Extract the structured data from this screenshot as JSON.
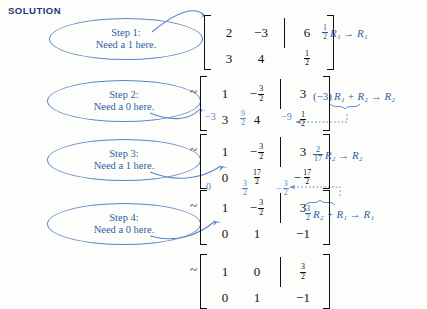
{
  "heading": "SOLUTION",
  "colors": {
    "heading_blue": "#123a76",
    "annotation_blue": "#5a86c8",
    "rowop_blue": "#2e5fa3",
    "matrix_black": "#111111",
    "page_background": "#fdfdfb"
  },
  "callouts": [
    {
      "title": "Step 1:",
      "text": "Need a 1 here."
    },
    {
      "title": "Step 2:",
      "text": "Need a 0 here."
    },
    {
      "title": "Step 3:",
      "text": "Need a 1 here."
    },
    {
      "title": "Step 4:",
      "text": "Need a 0 here."
    }
  ],
  "tilde": "~",
  "matrices": [
    {
      "name": "augmented-matrix-initial",
      "has_tilde": false,
      "rows": [
        {
          "c1": "2",
          "c2": "−3",
          "aug": "6"
        },
        {
          "c1": "3",
          "c2": "4",
          "aug_frac": {
            "num": "1",
            "den": "2"
          }
        }
      ]
    },
    {
      "name": "augmented-matrix-step1",
      "has_tilde": true,
      "rows": [
        {
          "c1": "1",
          "c2_frac_neg": {
            "num": "3",
            "den": "2"
          },
          "aug": "3"
        },
        {
          "c1": "3",
          "c2": "4",
          "aug_frac": {
            "num": "1",
            "den": "2"
          }
        }
      ]
    },
    {
      "name": "augmented-matrix-step2",
      "has_tilde": true,
      "rows": [
        {
          "c1": "1",
          "c2_frac_neg": {
            "num": "3",
            "den": "2"
          },
          "aug": "3"
        },
        {
          "c1": "0",
          "c2_frac": {
            "num": "17",
            "den": "2"
          },
          "aug_frac_neg": {
            "num": "17",
            "den": "2"
          }
        }
      ]
    },
    {
      "name": "augmented-matrix-step3",
      "has_tilde": true,
      "rows": [
        {
          "c1": "1",
          "c2_frac_neg": {
            "num": "3",
            "den": "2"
          },
          "aug": "3"
        },
        {
          "c1": "0",
          "c2": "1",
          "aug": "−1"
        }
      ]
    },
    {
      "name": "augmented-matrix-final",
      "has_tilde": true,
      "rows": [
        {
          "c1": "1",
          "c2": "0",
          "aug_frac": {
            "num": "3",
            "den": "2"
          }
        },
        {
          "c1": "0",
          "c2": "1",
          "aug": "−1"
        }
      ]
    }
  ],
  "row_operations": [
    {
      "name": "row-op-1",
      "coefficient": {
        "num": "1",
        "den": "2"
      },
      "text": "R₁ → R₁",
      "full": "½R₁ → R₁"
    },
    {
      "name": "row-op-2",
      "prefix": "(−3)",
      "text": "R₁ + R₂ → R₂",
      "full": "(−3)R₁ + R₂ → R₂"
    },
    {
      "name": "row-op-3",
      "coefficient": {
        "num": "2",
        "den": "17"
      },
      "text": "R₂ → R₂",
      "full": "2/17 R₂ → R₂"
    },
    {
      "name": "row-op-4",
      "coefficient": {
        "num": "3",
        "den": "2"
      },
      "text": "R₂ + R₁ → R₁",
      "full": "3/2 R₂ + R₁ → R₁"
    }
  ],
  "annotations_step2": {
    "col1": "−3",
    "col2": {
      "num": "9",
      "den": "2"
    },
    "aug": "−9"
  },
  "annotations_step4": {
    "col1": "0",
    "col2": {
      "num": "3",
      "den": "2"
    },
    "aug_neg": {
      "num": "3",
      "den": "2"
    }
  }
}
